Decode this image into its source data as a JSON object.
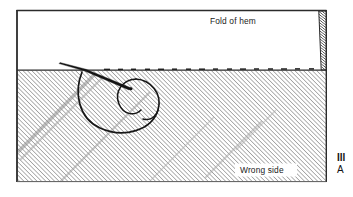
{
  "figure": {
    "labels": {
      "fold_of_hem": "Fold of hem",
      "wrong_side": "Wrong side"
    },
    "caption": {
      "line1": "Ill",
      "line2": "A"
    },
    "colors": {
      "ink": "#1a1a1a",
      "border": "#2b2b2b",
      "hatch": "#4a4a4a",
      "hatch_light": "#8f8f8f",
      "fabric_fill": "#ffffff",
      "page_background": "#ffffff",
      "label_background": "#ffffff",
      "cut_edge": "#3a3a3a"
    },
    "geometry": {
      "frame": {
        "x": 16,
        "y": 10,
        "width": 311,
        "height": 172
      },
      "fold_line_y": 70,
      "hatch_angle_deg": 45,
      "hatch_spacing_px": 3
    }
  }
}
